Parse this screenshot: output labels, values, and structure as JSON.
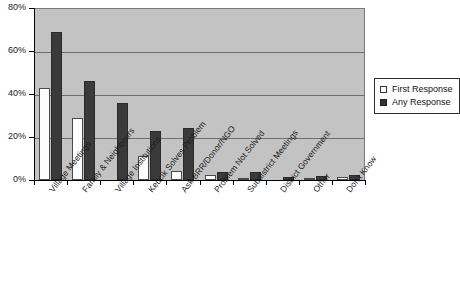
{
  "chart_data": {
    "type": "bar",
    "title": "",
    "subtitle": "",
    "xlabel": "",
    "ylabel": "",
    "ylim": [
      0,
      80
    ],
    "ytick_labels": [
      "0%",
      "20%",
      "40%",
      "60%",
      "80%"
    ],
    "ytick_values": [
      0,
      20,
      40,
      60,
      80
    ],
    "grid": true,
    "legend_position": "right",
    "categories": [
      "Village Meetings",
      "Family & Neighbours",
      "Village Institutions",
      "Keucik Solves Problem",
      "Ask BRR/Donor/NGO",
      "Problem Not Solved",
      "Subdistrict Meetings",
      "District Government",
      "Other",
      "Don't Know"
    ],
    "series": [
      {
        "name": "First Response",
        "color": "#ffffff",
        "values": [
          43,
          29,
          0,
          11,
          4,
          2.5,
          0.5,
          0,
          0.5,
          1.5
        ]
      },
      {
        "name": "Any Response",
        "color": "#3a3a3a",
        "values": [
          69,
          46,
          36,
          23,
          24,
          3.5,
          3.5,
          1.5,
          2,
          2.5
        ]
      }
    ]
  },
  "legend": {
    "entries": [
      {
        "label": "First Response",
        "swatch": "open-square-icon"
      },
      {
        "label": "Any Response",
        "swatch": "filled-square-icon"
      }
    ]
  },
  "colors": {
    "plot_background": "#c3c3c3",
    "gridline": "#6e6e6e",
    "axis": "#000000",
    "first_response_bar": "#ffffff",
    "any_response_bar": "#3a3a3a",
    "page_background": "#ffffff"
  }
}
